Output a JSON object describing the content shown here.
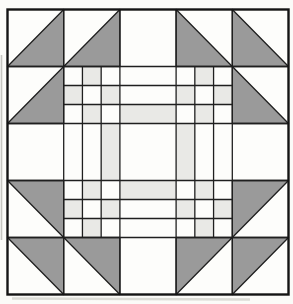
{
  "figure": {
    "type": "quilt-block-pattern",
    "canvas": {
      "width": 293,
      "height": 304,
      "page_bg": "#fbfbf8"
    },
    "block": {
      "x": 7.5,
      "y": 9.5,
      "width": 281,
      "height": 285,
      "cols": 5,
      "rows": 5,
      "fill": "#fdfdfb",
      "border_color": "#141414",
      "border_width": 2.4,
      "grid_color": "#1f1f1f",
      "grid_width": 1.3
    },
    "palette": {
      "gray": "#9a9a9a",
      "light": "#e9e9e6",
      "white": "#fdfdfb"
    },
    "half_square_triangles": [
      {
        "row": 0,
        "col": 0,
        "gray_corner": "bottom-right"
      },
      {
        "row": 0,
        "col": 1,
        "gray_corner": "bottom-right"
      },
      {
        "row": 0,
        "col": 3,
        "gray_corner": "bottom-left"
      },
      {
        "row": 0,
        "col": 4,
        "gray_corner": "bottom-left"
      },
      {
        "row": 1,
        "col": 0,
        "gray_corner": "bottom-right"
      },
      {
        "row": 1,
        "col": 4,
        "gray_corner": "bottom-left"
      },
      {
        "row": 3,
        "col": 0,
        "gray_corner": "top-right"
      },
      {
        "row": 3,
        "col": 4,
        "gray_corner": "top-left"
      },
      {
        "row": 4,
        "col": 0,
        "gray_corner": "top-right"
      },
      {
        "row": 4,
        "col": 1,
        "gray_corner": "top-right"
      },
      {
        "row": 4,
        "col": 3,
        "gray_corner": "top-left"
      },
      {
        "row": 4,
        "col": 4,
        "gray_corner": "top-left"
      }
    ],
    "nine_patch": {
      "cells": [
        [
          1,
          1
        ],
        [
          3,
          1
        ],
        [
          1,
          3
        ],
        [
          3,
          3
        ]
      ],
      "light_subsquares": [
        [
          1,
          0
        ],
        [
          0,
          1
        ],
        [
          2,
          1
        ],
        [
          1,
          2
        ]
      ]
    },
    "rail_cells": [
      {
        "col": 2,
        "row": 1,
        "orientation": "h",
        "light_index": 2
      },
      {
        "col": 1,
        "row": 2,
        "orientation": "v",
        "light_index": 2
      },
      {
        "col": 3,
        "row": 2,
        "orientation": "v",
        "light_index": 0
      },
      {
        "col": 2,
        "row": 3,
        "orientation": "h",
        "light_index": 0
      }
    ],
    "plain_white_cells": [
      [
        2,
        0
      ],
      [
        0,
        2
      ],
      [
        2,
        2
      ],
      [
        4,
        2
      ],
      [
        2,
        4
      ]
    ],
    "artifacts": {
      "left_edge_color": "#b9b9b4",
      "bottom_shadow_color": "#cfcfc9"
    }
  }
}
